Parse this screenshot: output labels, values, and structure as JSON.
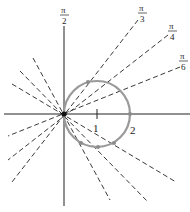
{
  "diagram": {
    "type": "polar-plot",
    "origin_px": [
      64,
      114
    ],
    "unit_px": 33,
    "colors": {
      "axes": "#222222",
      "rays": "#222222",
      "curve": "#9a9a9a",
      "points": "#8c8c8c",
      "background": "#ffffff"
    },
    "axis_ticks": [
      {
        "label": "1",
        "value": 1
      },
      {
        "label": "2",
        "value": 2
      }
    ],
    "angle_labels": [
      {
        "id": "pi-over-2",
        "numerator": "π",
        "denominator": "2"
      },
      {
        "id": "pi-over-3",
        "numerator": "π",
        "denominator": "3"
      },
      {
        "id": "pi-over-4",
        "numerator": "π",
        "denominator": "4"
      },
      {
        "id": "pi-over-6",
        "numerator": "π",
        "denominator": "6"
      }
    ],
    "rays_degrees": [
      30,
      45,
      60,
      120,
      135,
      150
    ],
    "curve": {
      "shape": "circle",
      "center_units": [
        1,
        0
      ],
      "radius_units": 1
    }
  }
}
